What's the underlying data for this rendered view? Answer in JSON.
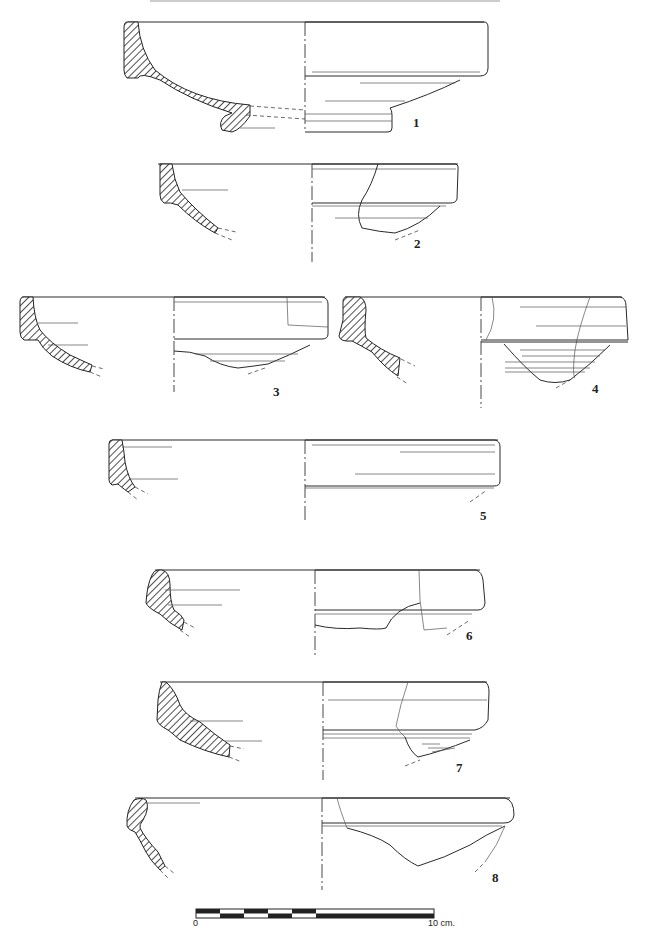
{
  "plate": {
    "header_text": "",
    "description": "Archaeological pottery profile drawings: eight bowl rim sections (left: hatched section profile, right: exterior view)"
  },
  "vessels": [
    {
      "id": "1",
      "label": "1"
    },
    {
      "id": "2",
      "label": "2"
    },
    {
      "id": "3",
      "label": "3"
    },
    {
      "id": "4",
      "label": "4"
    },
    {
      "id": "5",
      "label": "5"
    },
    {
      "id": "6",
      "label": "6"
    },
    {
      "id": "7",
      "label": "7"
    },
    {
      "id": "8",
      "label": "8"
    }
  ],
  "scale_bar": {
    "start_label": "0",
    "end_label": "10 cm.",
    "segments": 5
  },
  "colors": {
    "ink": "#222222",
    "paper": "#ffffff"
  }
}
